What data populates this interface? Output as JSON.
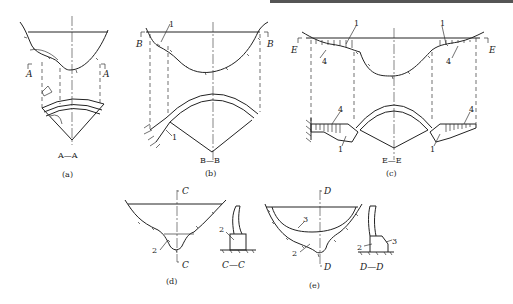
{
  "figure": {
    "panels": [
      {
        "id": "a",
        "caption": "(a)",
        "section_label": "A—A",
        "markers": [
          "A",
          "A"
        ]
      },
      {
        "id": "b",
        "caption": "(b)",
        "section_label": "B—B",
        "markers": [
          "B",
          "B"
        ],
        "callouts": [
          "1",
          "1"
        ]
      },
      {
        "id": "c",
        "caption": "(c)",
        "section_label": "E—E",
        "markers": [
          "E",
          "E"
        ],
        "callouts": [
          "1",
          "1",
          "4",
          "4",
          "4",
          "4",
          "1",
          "1"
        ]
      },
      {
        "id": "d",
        "caption": "(d)",
        "section_label": "C—C",
        "markers": [
          "C",
          "C"
        ],
        "callouts": [
          "2",
          "2"
        ]
      },
      {
        "id": "e",
        "caption": "(e)",
        "section_label": "D—D",
        "markers": [
          "D",
          "D"
        ],
        "callouts": [
          "3",
          "2",
          "2",
          "3"
        ]
      }
    ]
  }
}
